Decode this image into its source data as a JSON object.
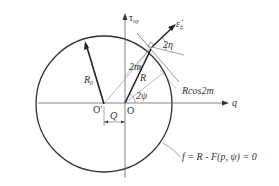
{
  "diagram": {
    "type": "yield surface in deviatoric stress plane",
    "axes": {
      "horizontal_label": "q",
      "vertical_label": "τ",
      "vertical_subscript": "oy"
    },
    "points": {
      "origin": "O",
      "shifted_origin": "O'",
      "offset_label": "Q"
    },
    "vectors": {
      "radius_initial": "R",
      "radius_initial_subscript": "0",
      "radius": "R",
      "strain_rate": "ε̇",
      "strain_rate_subscript": "ij"
    },
    "angles": {
      "eta": "2η",
      "psi": "2ψ",
      "m": "2m"
    },
    "annotations": {
      "projection": "Rcos2m",
      "yield_function": "f = R - F(p, ψ) = 0"
    },
    "colors": {
      "line": "#333333",
      "thin_line": "#666666",
      "background": "#ffffff"
    }
  }
}
